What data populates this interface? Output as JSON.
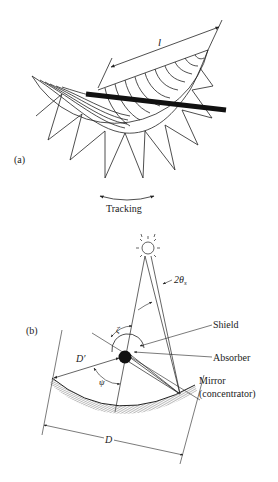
{
  "figure_a": {
    "panel_label": "(a)",
    "length_label": "l",
    "tracking_label": "Tracking"
  },
  "figure_b": {
    "panel_label": "(b)",
    "angle_sun_label": "2θ",
    "angle_sun_subscript": "s",
    "zeta_label": "ζ",
    "psi_label": "ψ",
    "d_prime_label": "D′",
    "d_label": "D",
    "shield_label": "Shield",
    "absorber_label": "Absorber",
    "mirror_label": "Mirror",
    "concentrator_label": "(concentrator)"
  },
  "colors": {
    "line": "#222222",
    "hatch": "#888888",
    "background": "#ffffff"
  }
}
